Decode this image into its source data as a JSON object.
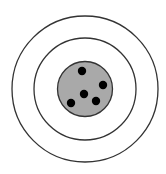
{
  "diagram": {
    "type": "target",
    "width": 166,
    "height": 174,
    "background": "#ffffff",
    "center": [
      85,
      89
    ],
    "rings": [
      {
        "name": "outer-ring",
        "r": 73,
        "fill": "none",
        "stroke": "#333333",
        "stroke_width": 1.3
      },
      {
        "name": "middle-ring",
        "r": 51,
        "fill": "none",
        "stroke": "#333333",
        "stroke_width": 1.3
      },
      {
        "name": "bullseye",
        "r": 27.5,
        "fill": "#a9a9a9",
        "stroke": "#333333",
        "stroke_width": 1.3
      }
    ],
    "dots": [
      {
        "x": 82,
        "y": 71,
        "r": 4.2,
        "fill": "#000000"
      },
      {
        "x": 103,
        "y": 85,
        "r": 4.2,
        "fill": "#000000"
      },
      {
        "x": 84,
        "y": 94,
        "r": 4.2,
        "fill": "#000000"
      },
      {
        "x": 96,
        "y": 101,
        "r": 4.2,
        "fill": "#000000"
      },
      {
        "x": 71,
        "y": 103,
        "r": 4.2,
        "fill": "#000000"
      }
    ]
  }
}
